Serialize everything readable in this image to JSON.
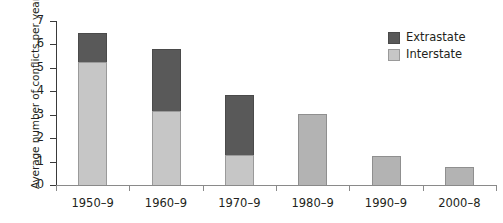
{
  "chart_data": {
    "type": "bar",
    "stacked": true,
    "title": "",
    "xlabel": "",
    "ylabel": "Average number of conflicts per year",
    "categories": [
      "1950–9",
      "1960–9",
      "1970–9",
      "1980–9",
      "1990–9",
      "2000–8"
    ],
    "series": [
      {
        "name": "Interstate",
        "color": "#c6c6c6",
        "values": [
          5.25,
          3.15,
          1.3,
          3.05,
          1.25,
          0.75
        ]
      },
      {
        "name": "Extrastate",
        "color": "#595959",
        "values": [
          1.25,
          2.65,
          2.55,
          0,
          0,
          0
        ]
      }
    ],
    "totals": [
      6.5,
      5.8,
      3.85,
      3.05,
      1.25,
      0.75
    ],
    "ylim": [
      0,
      7
    ],
    "yticks": [
      0,
      1,
      2,
      3,
      4,
      5,
      6,
      7
    ],
    "ytick_labels": [
      "0",
      "1",
      "2",
      "3",
      "4",
      "5",
      "6",
      "7"
    ],
    "grid": false,
    "legend_position": "top-right",
    "legend_order": [
      "Extrastate",
      "Interstate"
    ]
  },
  "legend": {
    "items": [
      {
        "label": "Extrastate",
        "swatch": "legend-swatch-extrastate"
      },
      {
        "label": "Interstate",
        "swatch": "legend-swatch-interstate"
      }
    ]
  },
  "colors": {
    "extrastate": "#595959",
    "interstate": "#c6c6c6",
    "axis": "#3a3a3a",
    "text": "#231f20"
  }
}
